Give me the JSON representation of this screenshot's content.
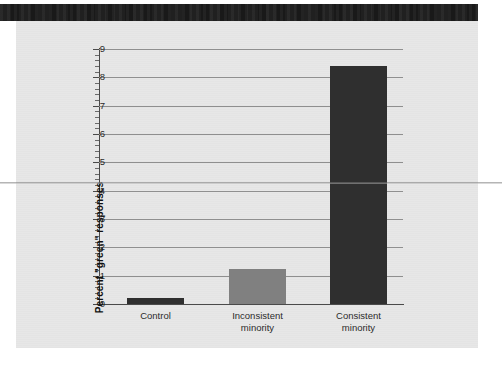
{
  "figure": {
    "background_color": "#e7e7e7",
    "page_color": "#ffffff",
    "scan_band_color": "#191919"
  },
  "chart_data": {
    "type": "bar",
    "title": "",
    "xlabel": "",
    "ylabel": "Percent \"green\" responses",
    "categories": [
      "Control",
      "Inconsistent minority",
      "Consistent minority"
    ],
    "category_lines": [
      [
        "Control"
      ],
      [
        "Inconsistent",
        "minority"
      ],
      [
        "Consistent",
        "minority"
      ]
    ],
    "values": [
      0.2,
      1.25,
      8.4
    ],
    "bar_colors": [
      "#2f2f2f",
      "#808080",
      "#2f2f2f"
    ],
    "ylim": [
      0,
      9
    ],
    "yticks": [
      0,
      1,
      2,
      3,
      4,
      5,
      6,
      7,
      8,
      9
    ],
    "ytick_labels": [
      "0",
      "1",
      "2",
      "3",
      "4",
      "5",
      "6",
      "7",
      "8",
      "9"
    ],
    "minor_ticks_per_interval": 4,
    "grid": "horizontal",
    "legend": "none",
    "axis_color": "#4a4a4a",
    "gridline_color": "#8f8f8f"
  }
}
